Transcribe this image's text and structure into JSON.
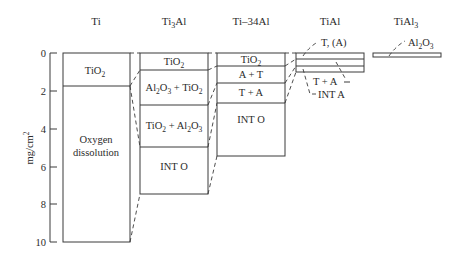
{
  "diagram": {
    "y_axis": {
      "label": "mg/cm²",
      "label_base": "mg/cm",
      "label_sup": "2",
      "ticks": [
        "0",
        "2",
        "4",
        "6",
        "8",
        "10"
      ]
    },
    "columns": [
      {
        "name": "Ti",
        "header": "Ti",
        "layers": [
          {
            "label": "TiO2",
            "text": "TiO",
            "sub": "2",
            "from": 0,
            "to": 1.75
          },
          {
            "label": "Oxygen dissolution",
            "line1": "Oxygen",
            "line2": "dissolution",
            "from": 1.75,
            "to": 10
          }
        ]
      },
      {
        "name": "Ti3Al",
        "header_base": "Ti",
        "header_sub": "3",
        "header_end": "Al",
        "layers": [
          {
            "label": "TiO2",
            "text": "TiO",
            "sub": "2",
            "from": 0,
            "to": 0.9
          },
          {
            "label": "Al2O3 + TiO2",
            "from": 0.9,
            "to": 2.75
          },
          {
            "label": "TiO2 + Al2O3",
            "from": 2.75,
            "to": 4.95
          },
          {
            "label": "INT O",
            "text": "INT O",
            "from": 4.95,
            "to": 7.45
          }
        ]
      },
      {
        "name": "Ti-34Al",
        "header": "Ti–34Al",
        "layers": [
          {
            "label": "TiO2",
            "text": "TiO",
            "sub": "2",
            "from": 0,
            "to": 0.7
          },
          {
            "label": "A + T",
            "text": "A + T",
            "from": 0.7,
            "to": 1.6
          },
          {
            "label": "T + A",
            "text": "T + A",
            "from": 1.6,
            "to": 2.65
          },
          {
            "label": "INT O",
            "text": "INT O",
            "from": 2.65,
            "to": 4.65
          }
        ]
      },
      {
        "name": "TiAl",
        "header": "TiAl",
        "layers": [
          {
            "label": "T, (A)",
            "text": "T, (A)",
            "from": 0,
            "to": 0.35
          },
          {
            "label": "T + A",
            "text": "T + A",
            "from": 0.35,
            "to": 0.7
          },
          {
            "label": "INT A",
            "text": "INT A",
            "from": 0.7,
            "to": 1.05
          }
        ]
      },
      {
        "name": "TiAl3",
        "header_base": "TiAl",
        "header_sub": "3",
        "layers": [
          {
            "label": "Al2O3",
            "text_base": "Al",
            "sub1": "2",
            "mid": "O",
            "sub2": "3",
            "from": 0,
            "to": 0.2
          }
        ]
      }
    ],
    "text": {
      "al2o3_tio2": {
        "a": "Al",
        "s1": "2",
        "b": "O",
        "s2": "3",
        "c": " + TiO",
        "s3": "2"
      },
      "tio2_al2o3": {
        "a": "TiO",
        "s1": "2",
        "b": " + Al",
        "s2": "2",
        "c": "O",
        "s3": "3"
      }
    }
  }
}
